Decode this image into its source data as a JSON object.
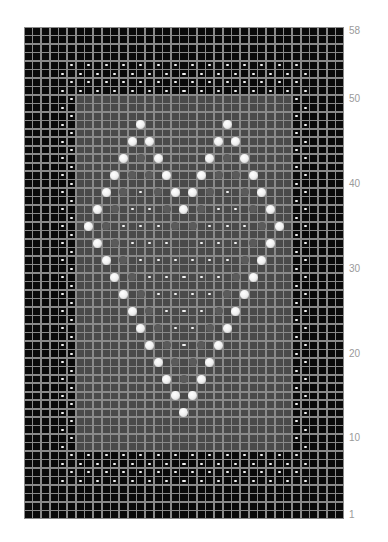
{
  "chart_data": {
    "type": "heatmap",
    "columns": 37,
    "rows": 58,
    "row_labels": [
      {
        "row": 58,
        "text": "58"
      },
      {
        "row": 50,
        "text": "50"
      },
      {
        "row": 40,
        "text": "40"
      },
      {
        "row": 30,
        "text": "30"
      },
      {
        "row": 20,
        "text": "20"
      },
      {
        "row": 10,
        "text": "10"
      },
      {
        "row": 1,
        "text": "1"
      }
    ],
    "colors": {
      "background_cell": "#0a0a0a",
      "center_panel_cell": "#4a4a4a",
      "grid_line": "#8a8a8a",
      "symbol": "#f2f2f2"
    },
    "center_panel": {
      "col_start": 7,
      "col_end": 31,
      "row_start": 9,
      "row_end": 50
    },
    "legend_symbols": {
      "dash": "purl stitch",
      "dot": "bobble",
      "black_square": "background stitch",
      "grey_square": "panel stitch"
    },
    "border_bands": {
      "top_rows": [
        54,
        53,
        52,
        51
      ],
      "bottom_rows": [
        8,
        7,
        6,
        5
      ],
      "even_row_cols": "even cols 6-32",
      "odd_row_cols": "odd cols 5-33"
    },
    "side_borders": {
      "rows": [
        9,
        50
      ],
      "even_row_cols": [
        6,
        32
      ],
      "odd_row_cols": [
        5,
        33
      ]
    },
    "heart_dots": [
      [
        14,
        47
      ],
      [
        24,
        47
      ],
      [
        13,
        45
      ],
      [
        15,
        45
      ],
      [
        23,
        45
      ],
      [
        25,
        45
      ],
      [
        12,
        43
      ],
      [
        16,
        43
      ],
      [
        22,
        43
      ],
      [
        26,
        43
      ],
      [
        11,
        41
      ],
      [
        17,
        41
      ],
      [
        21,
        41
      ],
      [
        27,
        41
      ],
      [
        10,
        39
      ],
      [
        18,
        39
      ],
      [
        20,
        39
      ],
      [
        28,
        39
      ],
      [
        9,
        37
      ],
      [
        19,
        37
      ],
      [
        29,
        37
      ],
      [
        8,
        35
      ],
      [
        30,
        35
      ],
      [
        9,
        33
      ],
      [
        29,
        33
      ],
      [
        10,
        31
      ],
      [
        28,
        31
      ],
      [
        11,
        29
      ],
      [
        27,
        29
      ],
      [
        12,
        27
      ],
      [
        26,
        27
      ],
      [
        13,
        25
      ],
      [
        25,
        25
      ],
      [
        14,
        23
      ],
      [
        24,
        23
      ],
      [
        15,
        21
      ],
      [
        23,
        21
      ],
      [
        16,
        19
      ],
      [
        22,
        19
      ],
      [
        17,
        17
      ],
      [
        21,
        17
      ],
      [
        18,
        15
      ],
      [
        20,
        15
      ],
      [
        19,
        13
      ]
    ],
    "heart_dashes": [
      [
        14,
        39
      ],
      [
        24,
        39
      ],
      [
        13,
        37
      ],
      [
        15,
        37
      ],
      [
        23,
        37
      ],
      [
        25,
        37
      ],
      [
        12,
        35
      ],
      [
        14,
        35
      ],
      [
        16,
        35
      ],
      [
        22,
        35
      ],
      [
        24,
        35
      ],
      [
        26,
        35
      ],
      [
        13,
        33
      ],
      [
        15,
        33
      ],
      [
        17,
        33
      ],
      [
        21,
        33
      ],
      [
        23,
        33
      ],
      [
        25,
        33
      ],
      [
        14,
        31
      ],
      [
        16,
        31
      ],
      [
        18,
        31
      ],
      [
        20,
        31
      ],
      [
        22,
        31
      ],
      [
        24,
        31
      ],
      [
        15,
        29
      ],
      [
        17,
        29
      ],
      [
        19,
        29
      ],
      [
        21,
        29
      ],
      [
        23,
        29
      ],
      [
        16,
        27
      ],
      [
        18,
        27
      ],
      [
        20,
        27
      ],
      [
        22,
        27
      ],
      [
        17,
        25
      ],
      [
        19,
        25
      ],
      [
        21,
        25
      ],
      [
        18,
        23
      ],
      [
        20,
        23
      ],
      [
        19,
        21
      ]
    ],
    "faint_dots": [
      [
        14,
        43
      ],
      [
        24,
        43
      ],
      [
        13,
        41
      ],
      [
        15,
        41
      ],
      [
        23,
        41
      ],
      [
        25,
        41
      ],
      [
        12,
        39
      ],
      [
        16,
        39
      ],
      [
        22,
        39
      ],
      [
        26,
        39
      ],
      [
        11,
        37
      ],
      [
        17,
        37
      ],
      [
        21,
        37
      ],
      [
        27,
        37
      ],
      [
        10,
        35
      ],
      [
        18,
        35
      ],
      [
        20,
        35
      ],
      [
        28,
        35
      ],
      [
        11,
        33
      ],
      [
        27,
        33
      ],
      [
        12,
        31
      ],
      [
        26,
        31
      ],
      [
        13,
        29
      ],
      [
        25,
        29
      ],
      [
        14,
        27
      ],
      [
        24,
        27
      ],
      [
        15,
        25
      ],
      [
        23,
        25
      ],
      [
        16,
        23
      ],
      [
        22,
        23
      ],
      [
        17,
        21
      ],
      [
        21,
        21
      ],
      [
        18,
        19
      ],
      [
        20,
        19
      ],
      [
        19,
        17
      ]
    ]
  }
}
